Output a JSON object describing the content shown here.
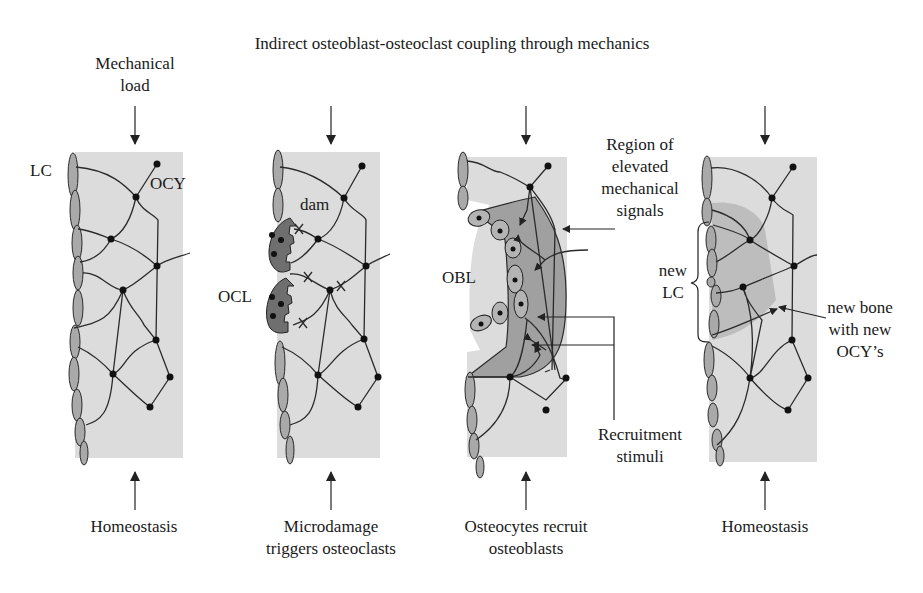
{
  "title": "Indirect osteoblast-osteoclast coupling through mechanics",
  "top_label": {
    "line1": "Mechanical",
    "line2": "load"
  },
  "panels": [
    {
      "id": "p1",
      "caption_line1": "Homeostasis",
      "caption_line2": "",
      "labels": {
        "lc": "LC",
        "ocy": "OCY"
      }
    },
    {
      "id": "p2",
      "caption_line1": "Microdamage",
      "caption_line2": "triggers osteoclasts",
      "labels": {
        "dam": "dam",
        "ocl": "OCL"
      }
    },
    {
      "id": "p3",
      "caption_line1": "Osteocytes recruit",
      "caption_line2": "osteoblasts",
      "labels": {
        "obl": "OBL",
        "region_line1": "Region of",
        "region_line2": "elevated",
        "region_line3": "mechanical",
        "region_line4": "signals",
        "recruit_line1": "Recruitment",
        "recruit_line2": "stimuli"
      }
    },
    {
      "id": "p4",
      "caption_line1": "Homeostasis",
      "caption_line2": "",
      "labels": {
        "newlc_line1": "new",
        "newlc_line2": "LC",
        "newbone_line1": "new bone",
        "newbone_line2": "with new",
        "newbone_line3": "OCY’s"
      }
    }
  ],
  "colors": {
    "bone_matrix": "#dcdcdc",
    "lining_cell": "#a9a9a9",
    "osteoclast": "#6f6f6f",
    "signal_region": "#a0a0a0",
    "node": "#111111"
  }
}
